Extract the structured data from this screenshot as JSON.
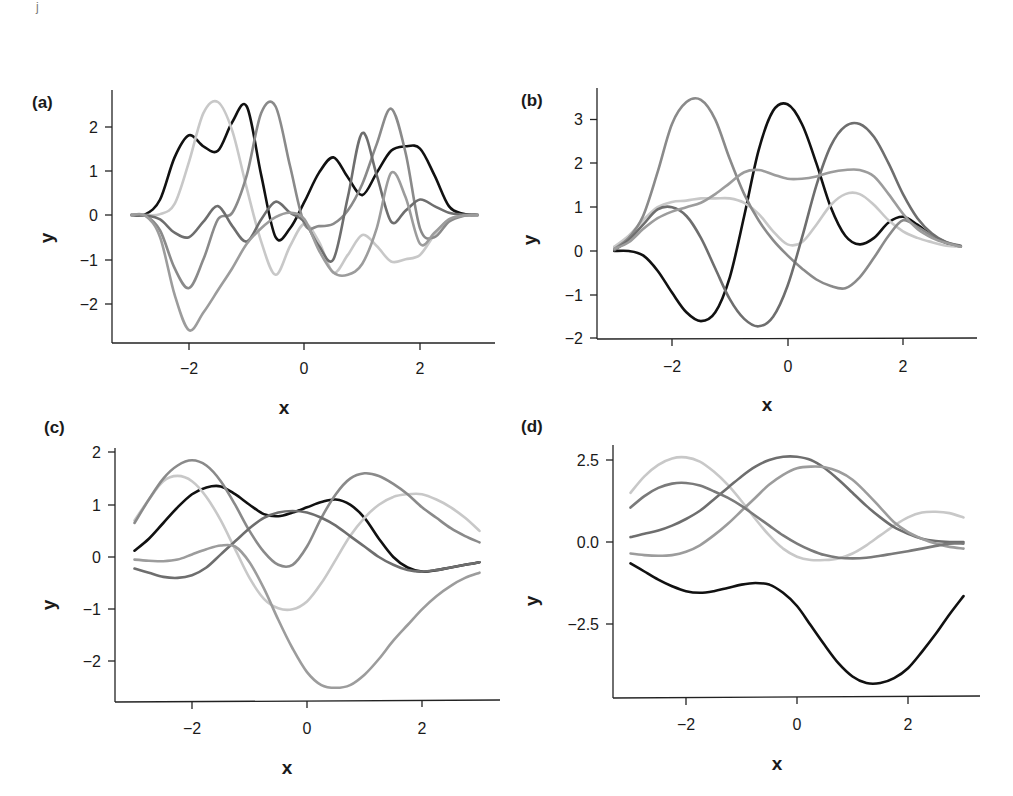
{
  "figure": {
    "artifact_mark": "j",
    "panels": [
      {
        "id": "a",
        "label": "(a)",
        "xlabel": "x",
        "ylabel": "y",
        "xticks": [
          "−2",
          "0",
          "2"
        ],
        "yticks": [
          "2",
          "1",
          "0",
          "−1",
          "−2"
        ]
      },
      {
        "id": "b",
        "label": "(b)",
        "xlabel": "x",
        "ylabel": "y",
        "xticks": [
          "−2",
          "0",
          "2"
        ],
        "yticks": [
          "3",
          "2",
          "1",
          "0",
          "−1",
          "−2"
        ]
      },
      {
        "id": "c",
        "label": "(c)",
        "xlabel": "x",
        "ylabel": "y",
        "xticks": [
          "−2",
          "0",
          "2"
        ],
        "yticks": [
          "2",
          "1",
          "0",
          "−1",
          "−2"
        ]
      },
      {
        "id": "d",
        "label": "(d)",
        "xlabel": "x",
        "ylabel": "y",
        "xticks": [
          "−2",
          "0",
          "2"
        ],
        "yticks": [
          "2.5",
          "0.0",
          "−2.5"
        ]
      }
    ]
  },
  "chart_data": [
    {
      "panel": "(a)",
      "type": "line",
      "title": "",
      "xlabel": "x",
      "ylabel": "y",
      "xlim": [
        -3.2,
        3.3
      ],
      "ylim": [
        -2.9,
        2.7
      ],
      "xticks": [
        -2,
        0,
        2
      ],
      "yticks": [
        -2,
        -1,
        0,
        1,
        2
      ],
      "grid": false,
      "legend": null,
      "x": [
        -3,
        -2.75,
        -2.5,
        -2.25,
        -2,
        -1.75,
        -1.5,
        -1.25,
        -1,
        -0.75,
        -0.5,
        -0.25,
        0,
        0.25,
        0.5,
        0.75,
        1,
        1.25,
        1.5,
        1.75,
        2,
        2.25,
        2.5,
        2.75,
        3
      ],
      "series": [
        {
          "name": "sample 1",
          "color": "#111111",
          "values": [
            0,
            0.02,
            0.35,
            1.3,
            1.8,
            1.55,
            1.45,
            2.1,
            2.45,
            0.9,
            -0.5,
            -0.3,
            0.3,
            0.95,
            1.3,
            0.85,
            0.45,
            0.95,
            1.45,
            1.55,
            1.5,
            0.9,
            0.2,
            0.03,
            0
          ]
        },
        {
          "name": "sample 2",
          "color": "#c8c8c8",
          "values": [
            0,
            0,
            0.02,
            0.25,
            1.2,
            2.3,
            2.55,
            1.9,
            0.6,
            -0.6,
            -1.35,
            -0.7,
            -0.2,
            -0.6,
            -1.3,
            -0.9,
            -0.45,
            -0.7,
            -1.05,
            -1.0,
            -0.9,
            -0.45,
            -0.1,
            -0.01,
            0
          ]
        },
        {
          "name": "sample 3",
          "color": "#8a8a8a",
          "values": [
            0,
            -0.02,
            -0.35,
            -1.2,
            -1.65,
            -1.0,
            -0.1,
            0.05,
            0.9,
            2.3,
            2.45,
            1.1,
            -0.2,
            -0.25,
            -0.2,
            0.1,
            0.7,
            1.6,
            2.4,
            1.4,
            -0.3,
            -0.5,
            -0.15,
            -0.02,
            0
          ]
        },
        {
          "name": "sample 4",
          "color": "#6e6e6e",
          "values": [
            0,
            -0.01,
            -0.1,
            -0.4,
            -0.5,
            -0.15,
            0.2,
            -0.25,
            -0.6,
            -0.1,
            0.3,
            0.05,
            -0.15,
            -0.7,
            -1.0,
            0.4,
            1.85,
            0.9,
            -0.15,
            0.1,
            0.35,
            0.2,
            0.05,
            0.01,
            0
          ]
        },
        {
          "name": "sample 5",
          "color": "#9c9c9c",
          "values": [
            0,
            -0.02,
            -0.5,
            -1.8,
            -2.6,
            -2.2,
            -1.7,
            -1.2,
            -0.65,
            -0.3,
            -0.05,
            0.05,
            -0.1,
            -0.8,
            -1.3,
            -1.35,
            -1.1,
            -0.3,
            0.95,
            0.4,
            -0.65,
            -0.4,
            -0.1,
            -0.01,
            0
          ]
        }
      ]
    },
    {
      "panel": "(b)",
      "type": "line",
      "title": "",
      "xlabel": "x",
      "ylabel": "y",
      "xlim": [
        -3.2,
        3.3
      ],
      "ylim": [
        -2.0,
        3.7
      ],
      "xticks": [
        -2,
        0,
        2
      ],
      "yticks": [
        -2,
        -1,
        0,
        1,
        2,
        3
      ],
      "grid": false,
      "legend": null,
      "x": [
        -3,
        -2.75,
        -2.5,
        -2.25,
        -2,
        -1.75,
        -1.5,
        -1.25,
        -1,
        -0.75,
        -0.5,
        -0.25,
        0,
        0.25,
        0.5,
        0.75,
        1,
        1.25,
        1.5,
        1.75,
        2,
        2.25,
        2.5,
        2.75,
        3
      ],
      "series": [
        {
          "name": "sample 1",
          "color": "#111111",
          "values": [
            0.0,
            0.0,
            -0.1,
            -0.45,
            -0.95,
            -1.4,
            -1.6,
            -1.4,
            -0.6,
            0.8,
            2.3,
            3.2,
            3.35,
            2.9,
            2.0,
            1.0,
            0.35,
            0.15,
            0.3,
            0.65,
            0.78,
            0.6,
            0.35,
            0.18,
            0.1
          ]
        },
        {
          "name": "sample 2",
          "color": "#c8c8c8",
          "values": [
            0.1,
            0.35,
            0.7,
            1.0,
            1.12,
            1.15,
            1.2,
            1.2,
            1.2,
            1.1,
            0.85,
            0.45,
            0.15,
            0.2,
            0.6,
            1.05,
            1.3,
            1.3,
            1.05,
            0.7,
            0.45,
            0.3,
            0.2,
            0.12,
            0.1
          ]
        },
        {
          "name": "sample 3",
          "color": "#8a8a8a",
          "values": [
            0.05,
            0.3,
            0.8,
            1.8,
            2.9,
            3.4,
            3.45,
            3.0,
            2.1,
            1.3,
            0.7,
            0.25,
            -0.1,
            -0.4,
            -0.65,
            -0.8,
            -0.85,
            -0.6,
            -0.15,
            0.35,
            0.7,
            0.55,
            0.35,
            0.2,
            0.1
          ]
        },
        {
          "name": "sample 4",
          "color": "#6e6e6e",
          "values": [
            0.02,
            0.25,
            0.6,
            0.95,
            1.0,
            0.8,
            0.3,
            -0.4,
            -1.1,
            -1.55,
            -1.72,
            -1.5,
            -0.8,
            0.3,
            1.5,
            2.4,
            2.85,
            2.9,
            2.6,
            2.0,
            1.3,
            0.75,
            0.4,
            0.2,
            0.12
          ]
        },
        {
          "name": "sample 5",
          "color": "#9c9c9c",
          "values": [
            0.05,
            0.2,
            0.5,
            0.75,
            0.9,
            1.0,
            1.1,
            1.3,
            1.55,
            1.8,
            1.85,
            1.75,
            1.65,
            1.65,
            1.7,
            1.8,
            1.85,
            1.85,
            1.7,
            1.3,
            0.85,
            0.5,
            0.3,
            0.18,
            0.1
          ]
        }
      ]
    },
    {
      "panel": "(c)",
      "type": "line",
      "title": "",
      "xlabel": "x",
      "ylabel": "y",
      "xlim": [
        -3.3,
        3.35
      ],
      "ylim": [
        -2.8,
        2.1
      ],
      "xticks": [
        -2,
        0,
        2
      ],
      "yticks": [
        -2,
        -1,
        0,
        1,
        2
      ],
      "grid": false,
      "legend": null,
      "x": [
        -3,
        -2.75,
        -2.5,
        -2.25,
        -2,
        -1.75,
        -1.5,
        -1.25,
        -1,
        -0.75,
        -0.5,
        -0.25,
        0,
        0.25,
        0.5,
        0.75,
        1,
        1.25,
        1.5,
        1.75,
        2,
        2.25,
        2.5,
        2.75,
        3
      ],
      "series": [
        {
          "name": "sample 1",
          "color": "#111111",
          "values": [
            0.12,
            0.35,
            0.65,
            0.95,
            1.2,
            1.33,
            1.35,
            1.2,
            1.0,
            0.82,
            0.78,
            0.85,
            0.95,
            1.05,
            1.1,
            1.0,
            0.75,
            0.35,
            0.0,
            -0.2,
            -0.28,
            -0.25,
            -0.2,
            -0.15,
            -0.1
          ]
        },
        {
          "name": "sample 2",
          "color": "#c8c8c8",
          "values": [
            0.7,
            1.1,
            1.45,
            1.55,
            1.45,
            1.15,
            0.7,
            0.15,
            -0.4,
            -0.8,
            -0.98,
            -1.0,
            -0.85,
            -0.5,
            -0.05,
            0.4,
            0.75,
            1.0,
            1.15,
            1.2,
            1.2,
            1.1,
            0.95,
            0.75,
            0.5
          ]
        },
        {
          "name": "sample 3",
          "color": "#8a8a8a",
          "values": [
            0.65,
            1.1,
            1.5,
            1.75,
            1.85,
            1.75,
            1.45,
            1.0,
            0.5,
            0.1,
            -0.15,
            -0.15,
            0.2,
            0.75,
            1.2,
            1.5,
            1.6,
            1.55,
            1.4,
            1.2,
            0.95,
            0.75,
            0.55,
            0.4,
            0.28
          ]
        },
        {
          "name": "sample 4",
          "color": "#6e6e6e",
          "values": [
            -0.22,
            -0.3,
            -0.38,
            -0.4,
            -0.35,
            -0.2,
            0.05,
            0.3,
            0.55,
            0.75,
            0.85,
            0.88,
            0.85,
            0.75,
            0.6,
            0.4,
            0.2,
            0.0,
            -0.15,
            -0.25,
            -0.28,
            -0.25,
            -0.2,
            -0.15,
            -0.1
          ]
        },
        {
          "name": "sample 5",
          "color": "#9c9c9c",
          "values": [
            -0.05,
            -0.07,
            -0.08,
            -0.05,
            0.05,
            0.15,
            0.22,
            0.2,
            -0.1,
            -0.6,
            -1.2,
            -1.75,
            -2.2,
            -2.45,
            -2.5,
            -2.45,
            -2.25,
            -1.95,
            -1.6,
            -1.3,
            -1.0,
            -0.75,
            -0.55,
            -0.4,
            -0.3
          ]
        }
      ]
    },
    {
      "panel": "(d)",
      "type": "line",
      "title": "",
      "xlabel": "x",
      "ylabel": "y",
      "xlim": [
        -3.3,
        3.35
      ],
      "ylim": [
        -4.75,
        2.95
      ],
      "xticks": [
        -2,
        0,
        2
      ],
      "yticks": [
        -2.5,
        0.0,
        2.5
      ],
      "grid": false,
      "legend": null,
      "x": [
        -3,
        -2.75,
        -2.5,
        -2.25,
        -2,
        -1.75,
        -1.5,
        -1.25,
        -1,
        -0.75,
        -0.5,
        -0.25,
        0,
        0.25,
        0.5,
        0.75,
        1,
        1.25,
        1.5,
        1.75,
        2,
        2.25,
        2.5,
        2.75,
        3
      ],
      "series": [
        {
          "name": "sample 1",
          "color": "#111111",
          "values": [
            -0.65,
            -0.9,
            -1.15,
            -1.35,
            -1.5,
            -1.55,
            -1.5,
            -1.4,
            -1.3,
            -1.25,
            -1.3,
            -1.55,
            -1.95,
            -2.55,
            -3.15,
            -3.7,
            -4.1,
            -4.3,
            -4.3,
            -4.15,
            -3.85,
            -3.35,
            -2.8,
            -2.2,
            -1.65
          ]
        },
        {
          "name": "sample 2",
          "color": "#c8c8c8",
          "values": [
            1.5,
            2.0,
            2.35,
            2.55,
            2.58,
            2.45,
            2.15,
            1.75,
            1.25,
            0.7,
            0.2,
            -0.2,
            -0.45,
            -0.55,
            -0.55,
            -0.5,
            -0.35,
            -0.1,
            0.2,
            0.5,
            0.75,
            0.9,
            0.92,
            0.88,
            0.75
          ]
        },
        {
          "name": "sample 3",
          "color": "#6e6e6e",
          "values": [
            0.15,
            0.25,
            0.35,
            0.5,
            0.7,
            0.95,
            1.3,
            1.65,
            2.0,
            2.3,
            2.5,
            2.6,
            2.6,
            2.5,
            2.25,
            1.9,
            1.5,
            1.1,
            0.75,
            0.45,
            0.25,
            0.1,
            0.03,
            0.0,
            0.0
          ]
        },
        {
          "name": "sample 4",
          "color": "#9c9c9c",
          "values": [
            -0.35,
            -0.4,
            -0.42,
            -0.4,
            -0.3,
            -0.1,
            0.2,
            0.55,
            0.95,
            1.35,
            1.75,
            2.05,
            2.25,
            2.3,
            2.28,
            2.15,
            1.9,
            1.5,
            1.05,
            0.6,
            0.3,
            0.1,
            -0.05,
            -0.15,
            -0.2
          ]
        },
        {
          "name": "sample 5",
          "color": "#7a7a7a",
          "values": [
            1.05,
            1.4,
            1.65,
            1.78,
            1.8,
            1.72,
            1.55,
            1.35,
            1.1,
            0.8,
            0.5,
            0.2,
            -0.05,
            -0.25,
            -0.4,
            -0.48,
            -0.5,
            -0.48,
            -0.42,
            -0.35,
            -0.28,
            -0.2,
            -0.12,
            -0.05,
            -0.05
          ]
        }
      ]
    }
  ]
}
